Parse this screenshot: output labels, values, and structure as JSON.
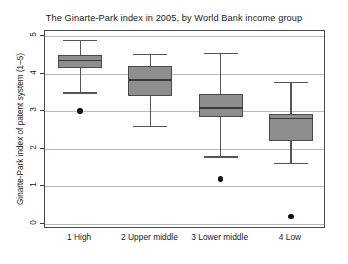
{
  "chart_data": {
    "type": "box",
    "title": "The Ginarte-Park index in 2005, by World Bank income group",
    "xlabel": "",
    "ylabel": "Ginarte-Park index of patent system (1–5)",
    "ylim": [
      0,
      5
    ],
    "yticks": [
      "0",
      "1",
      "2",
      "3",
      "4",
      "5"
    ],
    "grid": true,
    "legend": "none",
    "categories": [
      "1 High",
      "2 Upper middle",
      "3 Lower middle",
      "4 Low"
    ],
    "boxes": [
      {
        "category": "1 High",
        "whisker_low": 3.5,
        "q1": 4.15,
        "median": 4.35,
        "q3": 4.5,
        "whisker_high": 4.9,
        "outliers": [
          3.0
        ]
      },
      {
        "category": "2 Upper middle",
        "whisker_low": 2.6,
        "q1": 3.4,
        "median": 3.83,
        "q3": 4.2,
        "whisker_high": 4.52,
        "outliers": []
      },
      {
        "category": "3 Lower middle",
        "whisker_low": 1.8,
        "q1": 2.85,
        "median": 3.08,
        "q3": 3.47,
        "whisker_high": 4.56,
        "outliers": [
          1.2
        ]
      },
      {
        "category": "4 Low",
        "whisker_low": 1.62,
        "q1": 2.2,
        "median": 2.8,
        "q3": 2.92,
        "whisker_high": 3.78,
        "outliers": [
          0.2
        ]
      }
    ],
    "colors": {
      "box_fill": "#8e8e8e",
      "box_border": "#4a4a4a",
      "median": "#3a3a3a",
      "whisker": "#555555",
      "outlier": "#111111",
      "gridline": "#b9b9b9",
      "frame": "#4a4a4a",
      "background": "#ffffff",
      "text": "#1a1a1a"
    }
  }
}
